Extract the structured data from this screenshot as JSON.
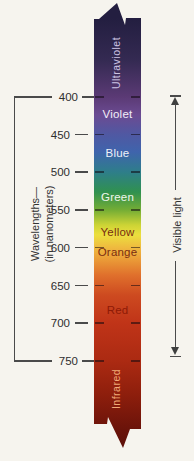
{
  "figure": {
    "left_axis": {
      "label_line1": "Wavelengths—",
      "label_line2": "(in nanometers)"
    },
    "right_axis": {
      "label": "Visible light"
    },
    "scale": {
      "unit": "nm",
      "nm_min": 400,
      "nm_max": 750,
      "y_at_min": 97,
      "y_at_max": 361,
      "ticks": [
        {
          "label": "400",
          "nm": 400,
          "major": true
        },
        {
          "label": "450",
          "nm": 450,
          "major": false
        },
        {
          "label": "500",
          "nm": 500,
          "major": false
        },
        {
          "label": "550",
          "nm": 550,
          "major": false
        },
        {
          "label": "600",
          "nm": 600,
          "major": false
        },
        {
          "label": "650",
          "nm": 650,
          "major": false
        },
        {
          "label": "700",
          "nm": 700,
          "major": false
        },
        {
          "label": "750",
          "nm": 750,
          "major": true
        }
      ]
    },
    "bands": [
      {
        "name": "Ultraviolet",
        "range_nm": "< 400",
        "rotated": true,
        "text_color": "#cdc4e4",
        "label_nm": 355
      },
      {
        "name": "Violet",
        "range_nm": "400–450",
        "rotated": false,
        "text_color": "#f1eef8",
        "label_nm": 423
      },
      {
        "name": "Blue",
        "range_nm": "450–500",
        "rotated": false,
        "text_color": "#eef2f8",
        "label_nm": 474
      },
      {
        "name": "Green",
        "range_nm": "500–550",
        "rotated": false,
        "text_color": "#eef6ee",
        "label_nm": 533
      },
      {
        "name": "Yellow",
        "range_nm": "550–600",
        "rotated": false,
        "text_color": "#7b2c12",
        "label_nm": 579
      },
      {
        "name": "Orange",
        "range_nm": "600–650",
        "rotated": false,
        "text_color": "#7b2c12",
        "label_nm": 606
      },
      {
        "name": "Red",
        "range_nm": "650–750",
        "rotated": false,
        "text_color": "#8e1a06",
        "label_nm": 683
      },
      {
        "name": "Infrared",
        "range_nm": "> 750",
        "rotated": true,
        "text_color": "#f0aa78",
        "label_nm": 787
      }
    ],
    "colors": {
      "line": "#4a4a4a",
      "text": "#2e2e2e",
      "paper": "#f6f4ee"
    }
  }
}
